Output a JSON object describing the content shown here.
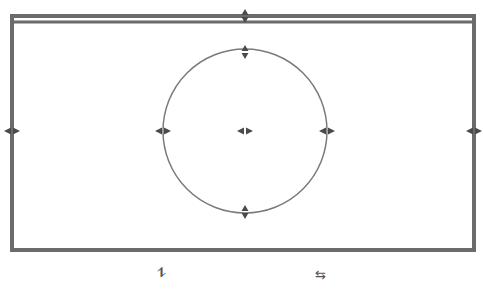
{
  "canvas": {
    "width": 483,
    "height": 289,
    "background": "#ffffff",
    "stroke_color": "#6b6b6b",
    "handle_color": "#4a4a4a"
  },
  "frame": {
    "x": 12,
    "y": 16,
    "width": 462,
    "height": 234,
    "double_top_offset": 6
  },
  "circle": {
    "cx": 245,
    "cy": 131,
    "r": 82
  },
  "handles": [
    {
      "name": "frame-top-handle",
      "x": 245,
      "y": 16,
      "dir": "vertical"
    },
    {
      "name": "frame-left-handle",
      "x": 12,
      "y": 131,
      "dir": "horizontal"
    },
    {
      "name": "frame-right-handle",
      "x": 474,
      "y": 131,
      "dir": "horizontal"
    },
    {
      "name": "circle-top-handle",
      "x": 245,
      "y": 52,
      "dir": "vertical"
    },
    {
      "name": "circle-bottom-handle",
      "x": 245,
      "y": 212,
      "dir": "vertical"
    },
    {
      "name": "circle-left-handle",
      "x": 163,
      "y": 131,
      "dir": "horizontal"
    },
    {
      "name": "circle-right-handle",
      "x": 327,
      "y": 131,
      "dir": "horizontal"
    },
    {
      "name": "circle-center-handle",
      "x": 245,
      "y": 131,
      "dir": "horizontal"
    }
  ],
  "bottom_icons": {
    "vertical_flip": {
      "glyph": "⥮",
      "x": 157,
      "y": 266
    },
    "horizontal_swap": {
      "glyph": "⇆",
      "x": 315,
      "y": 268
    }
  }
}
